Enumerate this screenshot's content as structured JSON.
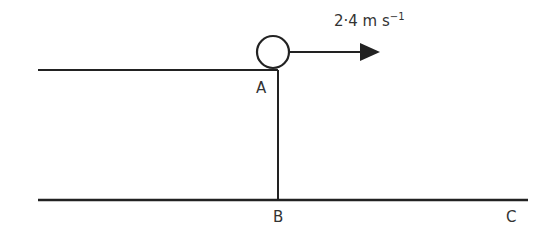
{
  "diagram": {
    "velocity_label": "2·4 m s",
    "velocity_exponent": "−1",
    "points": {
      "A": "A",
      "B": "B",
      "C": "C"
    },
    "colors": {
      "line": "#222222",
      "text": "#333333",
      "background": "#ffffff"
    }
  }
}
